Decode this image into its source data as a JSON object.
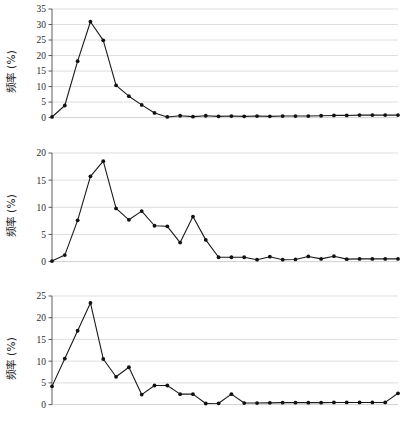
{
  "figure": {
    "background": "#ffffff",
    "panel_count": 3,
    "shared_ylabel": "频率 (%)",
    "line_color": "#1a1a1a",
    "marker_color": "#111111",
    "grid_color": "#d0d0d0"
  },
  "chart_data": [
    {
      "type": "line",
      "title": "",
      "xlabel": "",
      "ylabel": "频率 (%)",
      "ylim": [
        0,
        35
      ],
      "yticks": [
        0,
        5,
        10,
        15,
        20,
        25,
        30,
        35
      ],
      "ytick_labels": [
        "0",
        "5",
        "10",
        "15",
        "20",
        "25",
        "30",
        "35"
      ],
      "xlim": [
        0,
        27
      ],
      "xticks": [],
      "xtick_labels": [],
      "grid": true,
      "legend": false,
      "x": [
        0,
        1,
        2,
        3,
        4,
        5,
        6,
        7,
        8,
        9,
        10,
        11,
        12,
        13,
        14,
        15,
        16,
        17,
        18,
        19,
        20,
        21,
        22,
        23,
        24,
        25,
        26,
        27
      ],
      "values": [
        0.2,
        3.9,
        18.2,
        30.9,
        24.9,
        10.4,
        6.9,
        4.1,
        1.5,
        0.2,
        0.6,
        0.3,
        0.6,
        0.4,
        0.5,
        0.4,
        0.5,
        0.4,
        0.5,
        0.5,
        0.5,
        0.6,
        0.7,
        0.7,
        0.8,
        0.8,
        0.8,
        0.8
      ]
    },
    {
      "type": "line",
      "title": "",
      "xlabel": "",
      "ylabel": "频率 (%)",
      "ylim": [
        0,
        20
      ],
      "yticks": [
        0,
        5,
        10,
        15,
        20
      ],
      "ytick_labels": [
        "0",
        "5",
        "10",
        "15",
        "20"
      ],
      "xlim": [
        0,
        27
      ],
      "xticks": [],
      "xtick_labels": [],
      "grid": true,
      "legend": false,
      "x": [
        0,
        1,
        2,
        3,
        4,
        5,
        6,
        7,
        8,
        9,
        10,
        11,
        12,
        13,
        14,
        15,
        16,
        17,
        18,
        19,
        20,
        21,
        22,
        23,
        24,
        25,
        26,
        27
      ],
      "values": [
        0.1,
        1.2,
        7.6,
        15.7,
        18.5,
        9.8,
        7.7,
        9.3,
        6.6,
        6.5,
        3.5,
        8.3,
        4.0,
        0.8,
        0.8,
        0.8,
        0.35,
        0.9,
        0.35,
        0.4,
        0.95,
        0.5,
        1.0,
        0.45,
        0.5,
        0.5,
        0.5,
        0.5
      ]
    },
    {
      "type": "line",
      "title": "",
      "xlabel": "",
      "ylabel": "频率 (%)",
      "ylim": [
        0,
        25
      ],
      "yticks": [
        0,
        5,
        10,
        15,
        20,
        25
      ],
      "ytick_labels": [
        "0",
        "5",
        "10",
        "15",
        "20",
        "25"
      ],
      "xlim": [
        0,
        27
      ],
      "xticks": [],
      "xtick_labels": [],
      "grid": true,
      "legend": false,
      "x": [
        0,
        1,
        2,
        3,
        4,
        5,
        6,
        7,
        8,
        9,
        10,
        11,
        12,
        13,
        14,
        15,
        16,
        17,
        18,
        19,
        20,
        21,
        22,
        23,
        24,
        25,
        26,
        27
      ],
      "values": [
        4.2,
        10.6,
        17.0,
        23.4,
        10.5,
        6.4,
        8.6,
        2.3,
        4.4,
        4.4,
        2.4,
        2.4,
        0.25,
        0.3,
        2.4,
        0.35,
        0.35,
        0.4,
        0.45,
        0.45,
        0.45,
        0.45,
        0.5,
        0.5,
        0.5,
        0.5,
        0.5,
        2.6
      ]
    }
  ]
}
